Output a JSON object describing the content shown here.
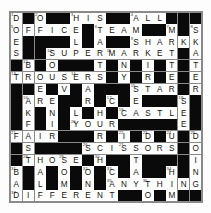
{
  "puzzle": {
    "title": "Crossword Grid",
    "rows": 16,
    "columns": 16,
    "colors": {
      "block": "#0a0a0a",
      "cell": "#ffffff",
      "grid_line": "#8a8a8a",
      "letter": "#111111",
      "number": "#333333"
    },
    "grid": [
      [
        {
          "b": false,
          "l": "D",
          "n": "1"
        },
        {
          "b": true
        },
        {
          "b": false,
          "l": "O",
          "n": "2"
        },
        {
          "b": true
        },
        {
          "b": true
        },
        {
          "b": false,
          "l": "H",
          "n": "3"
        },
        {
          "b": false,
          "l": "I"
        },
        {
          "b": false,
          "l": "S"
        },
        {
          "b": true
        },
        {
          "b": true
        },
        {
          "b": false,
          "l": "A",
          "n": "4"
        },
        {
          "b": false,
          "l": "L"
        },
        {
          "b": false,
          "l": "L"
        },
        {
          "b": true
        },
        {
          "b": true
        },
        {
          "b": true
        }
      ],
      [
        {
          "b": false,
          "l": "O",
          "n": "5"
        },
        {
          "b": false,
          "l": "F"
        },
        {
          "b": false,
          "l": "F"
        },
        {
          "b": false,
          "l": "I"
        },
        {
          "b": false,
          "l": "C"
        },
        {
          "b": false,
          "l": "E"
        },
        {
          "b": true
        },
        {
          "b": false,
          "l": "T",
          "n": "6"
        },
        {
          "b": false,
          "l": "E"
        },
        {
          "b": false,
          "l": "A"
        },
        {
          "b": false,
          "l": "M"
        },
        {
          "b": true
        },
        {
          "b": true
        },
        {
          "b": false,
          "l": "M",
          "n": "7"
        },
        {
          "b": true
        },
        {
          "b": false,
          "l": "S",
          "n": "8"
        }
      ],
      [
        {
          "b": false,
          "l": "E"
        },
        {
          "b": true
        },
        {
          "b": true
        },
        {
          "b": true
        },
        {
          "b": true
        },
        {
          "b": false,
          "l": "L"
        },
        {
          "b": true
        },
        {
          "b": false,
          "l": "A"
        },
        {
          "b": true
        },
        {
          "b": true
        },
        {
          "b": false,
          "l": "S",
          "n": "9"
        },
        {
          "b": false,
          "l": "H"
        },
        {
          "b": false,
          "l": "A"
        },
        {
          "b": false,
          "l": "R"
        },
        {
          "b": false,
          "l": "K"
        },
        {
          "b": false,
          "l": "K"
        }
      ],
      [
        {
          "b": false,
          "l": "S"
        },
        {
          "b": true
        },
        {
          "b": true
        },
        {
          "b": false,
          "l": "S",
          "n": "10"
        },
        {
          "b": false,
          "l": "U"
        },
        {
          "b": false,
          "l": "P"
        },
        {
          "b": false,
          "l": "E"
        },
        {
          "b": false,
          "l": "R"
        },
        {
          "b": false,
          "l": "M",
          "n": "11"
        },
        {
          "b": false,
          "l": "A"
        },
        {
          "b": false,
          "l": "R"
        },
        {
          "b": false,
          "l": "K"
        },
        {
          "b": false,
          "l": "E"
        },
        {
          "b": false,
          "l": "T"
        },
        {
          "b": true
        },
        {
          "b": false,
          "l": "A"
        }
      ],
      [
        {
          "b": true
        },
        {
          "b": false,
          "l": "B",
          "n": "12"
        },
        {
          "b": true
        },
        {
          "b": false,
          "l": "O"
        },
        {
          "b": true
        },
        {
          "b": true
        },
        {
          "b": true
        },
        {
          "b": false,
          "l": "T"
        },
        {
          "b": true
        },
        {
          "b": false,
          "l": "N"
        },
        {
          "b": true
        },
        {
          "b": false,
          "l": "I"
        },
        {
          "b": true
        },
        {
          "b": false,
          "l": "T"
        },
        {
          "b": true
        },
        {
          "b": false,
          "l": "T"
        }
      ],
      [
        {
          "b": false,
          "l": "T",
          "n": "13"
        },
        {
          "b": false,
          "l": "R"
        },
        {
          "b": false,
          "l": "O"
        },
        {
          "b": false,
          "l": "U"
        },
        {
          "b": false,
          "l": "S"
        },
        {
          "b": false,
          "l": "E",
          "n": "14"
        },
        {
          "b": false,
          "l": "R"
        },
        {
          "b": false,
          "l": "S"
        },
        {
          "b": true
        },
        {
          "b": false,
          "l": "Y"
        },
        {
          "b": true
        },
        {
          "b": false,
          "l": "R"
        },
        {
          "b": true
        },
        {
          "b": false,
          "l": "E"
        },
        {
          "b": true
        },
        {
          "b": false,
          "l": "E"
        }
      ],
      [
        {
          "b": true
        },
        {
          "b": true
        },
        {
          "b": false,
          "l": "E"
        },
        {
          "b": true
        },
        {
          "b": false,
          "l": "V"
        },
        {
          "b": true
        },
        {
          "b": false,
          "l": "A"
        },
        {
          "b": true
        },
        {
          "b": true
        },
        {
          "b": true
        },
        {
          "b": false,
          "l": "S",
          "n": "15"
        },
        {
          "b": false,
          "l": "T"
        },
        {
          "b": false,
          "l": "A"
        },
        {
          "b": false,
          "l": "R"
        },
        {
          "b": true
        },
        {
          "b": false,
          "l": "R"
        }
      ],
      [
        {
          "b": true
        },
        {
          "b": false,
          "l": "A",
          "n": "16"
        },
        {
          "b": false,
          "l": "R"
        },
        {
          "b": false,
          "l": "E"
        },
        {
          "b": true
        },
        {
          "b": true
        },
        {
          "b": false,
          "l": "R"
        },
        {
          "b": true
        },
        {
          "b": false,
          "l": "C",
          "n": "17"
        },
        {
          "b": true
        },
        {
          "b": false,
          "l": "E"
        },
        {
          "b": true
        },
        {
          "b": true
        },
        {
          "b": true
        },
        {
          "b": false,
          "l": "S",
          "n": "18"
        },
        {
          "b": true
        }
      ],
      [
        {
          "b": true
        },
        {
          "b": false,
          "l": "K"
        },
        {
          "b": true
        },
        {
          "b": false,
          "l": "N"
        },
        {
          "b": true
        },
        {
          "b": false,
          "l": "L"
        },
        {
          "b": true
        },
        {
          "b": false,
          "l": "H"
        },
        {
          "b": true
        },
        {
          "b": false,
          "l": "C",
          "n": "19"
        },
        {
          "b": false,
          "l": "A"
        },
        {
          "b": false,
          "l": "S"
        },
        {
          "b": false,
          "l": "T"
        },
        {
          "b": false,
          "l": "L"
        },
        {
          "b": false,
          "l": "E"
        },
        {
          "b": true
        }
      ],
      [
        {
          "b": true
        },
        {
          "b": false,
          "l": "F"
        },
        {
          "b": true
        },
        {
          "b": false,
          "l": "I"
        },
        {
          "b": true
        },
        {
          "b": false,
          "l": "Y",
          "n": "20"
        },
        {
          "b": false,
          "l": "O"
        },
        {
          "b": false,
          "l": "U"
        },
        {
          "b": false,
          "l": "R"
        },
        {
          "b": true
        },
        {
          "b": true
        },
        {
          "b": true
        },
        {
          "b": true
        },
        {
          "b": true
        },
        {
          "b": false,
          "l": "E"
        },
        {
          "b": true
        }
      ],
      [
        {
          "b": false,
          "l": "F",
          "n": "21"
        },
        {
          "b": false,
          "l": "A"
        },
        {
          "b": false,
          "l": "I"
        },
        {
          "b": false,
          "l": "R"
        },
        {
          "b": true
        },
        {
          "b": true
        },
        {
          "b": true
        },
        {
          "b": false,
          "l": "R"
        },
        {
          "b": true
        },
        {
          "b": false,
          "l": "I",
          "n": "22"
        },
        {
          "b": true
        },
        {
          "b": false,
          "l": "D",
          "n": "23"
        },
        {
          "b": true
        },
        {
          "b": false,
          "l": "U",
          "n": "24"
        },
        {
          "b": true
        },
        {
          "b": false,
          "l": "D",
          "n": "25"
        }
      ],
      [
        {
          "b": true
        },
        {
          "b": false,
          "l": "S"
        },
        {
          "b": true
        },
        {
          "b": true
        },
        {
          "b": true
        },
        {
          "b": true
        },
        {
          "b": false,
          "l": "S",
          "n": "26"
        },
        {
          "b": false,
          "l": "C"
        },
        {
          "b": false,
          "l": "I"
        },
        {
          "b": false,
          "l": "S",
          "n": "27"
        },
        {
          "b": false,
          "l": "S"
        },
        {
          "b": false,
          "l": "O"
        },
        {
          "b": false,
          "l": "R"
        },
        {
          "b": false,
          "l": "S"
        },
        {
          "b": true
        },
        {
          "b": false,
          "l": "O"
        }
      ],
      [
        {
          "b": true
        },
        {
          "b": false,
          "l": "T",
          "n": "28"
        },
        {
          "b": false,
          "l": "H"
        },
        {
          "b": false,
          "l": "O"
        },
        {
          "b": false,
          "l": "S",
          "n": "29"
        },
        {
          "b": false,
          "l": "E"
        },
        {
          "b": true
        },
        {
          "b": false,
          "l": "H",
          "n": "30"
        },
        {
          "b": true
        },
        {
          "b": true
        },
        {
          "b": false,
          "l": "T"
        },
        {
          "b": true
        },
        {
          "b": true
        },
        {
          "b": true
        },
        {
          "b": true
        },
        {
          "b": false,
          "l": "I"
        }
      ],
      [
        {
          "b": false,
          "l": "B",
          "n": "31"
        },
        {
          "b": true
        },
        {
          "b": false,
          "l": "A"
        },
        {
          "b": true
        },
        {
          "b": false,
          "l": "O"
        },
        {
          "b": true
        },
        {
          "b": false,
          "l": "O",
          "n": "32"
        },
        {
          "b": true
        },
        {
          "b": false,
          "l": "C",
          "n": "33"
        },
        {
          "b": true
        },
        {
          "b": false,
          "l": "A"
        },
        {
          "b": true
        },
        {
          "b": true
        },
        {
          "b": false,
          "l": "H",
          "n": "34"
        },
        {
          "b": true
        },
        {
          "b": false,
          "l": "N"
        }
      ],
      [
        {
          "b": false,
          "l": "A"
        },
        {
          "b": true
        },
        {
          "b": false,
          "l": "L"
        },
        {
          "b": true
        },
        {
          "b": false,
          "l": "M"
        },
        {
          "b": true
        },
        {
          "b": false,
          "l": "N"
        },
        {
          "b": true
        },
        {
          "b": false,
          "l": "A",
          "n": "35"
        },
        {
          "b": false,
          "l": "N"
        },
        {
          "b": false,
          "l": "Y"
        },
        {
          "b": false,
          "l": "T",
          "n": "36"
        },
        {
          "b": false,
          "l": "H"
        },
        {
          "b": false,
          "l": "I"
        },
        {
          "b": false,
          "l": "N"
        },
        {
          "b": false,
          "l": "G"
        }
      ],
      [
        {
          "b": false,
          "l": "D",
          "n": "37"
        },
        {
          "b": false,
          "l": "I"
        },
        {
          "b": false,
          "l": "F"
        },
        {
          "b": false,
          "l": "F"
        },
        {
          "b": false,
          "l": "E"
        },
        {
          "b": false,
          "l": "R"
        },
        {
          "b": false,
          "l": "E"
        },
        {
          "b": false,
          "l": "N"
        },
        {
          "b": false,
          "l": "T"
        },
        {
          "b": true
        },
        {
          "b": true
        },
        {
          "b": false,
          "l": "O"
        },
        {
          "b": true
        },
        {
          "b": false,
          "l": "M"
        },
        {
          "b": true
        },
        {
          "b": true
        }
      ]
    ]
  }
}
